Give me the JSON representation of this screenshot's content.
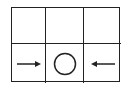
{
  "diagram": {
    "rows": 2,
    "cols": 3,
    "line_color": "#222222",
    "cells": [
      {
        "row": 1,
        "col": 1,
        "symbol": "empty"
      },
      {
        "row": 1,
        "col": 2,
        "symbol": "empty"
      },
      {
        "row": 1,
        "col": 3,
        "symbol": "empty"
      },
      {
        "row": 2,
        "col": 1,
        "symbol": "arrow-right-icon"
      },
      {
        "row": 2,
        "col": 2,
        "symbol": "circle-icon"
      },
      {
        "row": 2,
        "col": 3,
        "symbol": "arrow-left-icon"
      }
    ]
  }
}
